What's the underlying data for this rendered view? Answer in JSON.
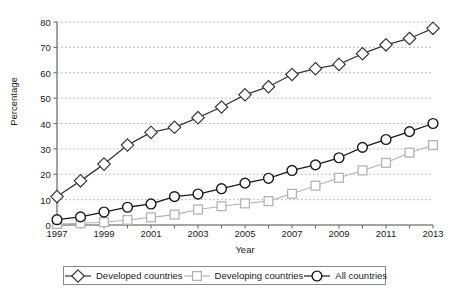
{
  "chart_data": {
    "type": "line",
    "title": "",
    "xlabel": "Year",
    "ylabel": "Percentage",
    "xlim": [
      1997,
      2013
    ],
    "ylim": [
      0,
      80
    ],
    "yticks": [
      0,
      10,
      20,
      30,
      40,
      50,
      60,
      70,
      80
    ],
    "xticks": [
      1997,
      1998,
      1999,
      2000,
      2001,
      2002,
      2003,
      2004,
      2005,
      2006,
      2007,
      2008,
      2009,
      2010,
      2011,
      2012,
      2013
    ],
    "xtick_labels_shown": [
      1997,
      1999,
      2001,
      2003,
      2005,
      2007,
      2009,
      2011,
      2013
    ],
    "grid": "horizontal-dotted",
    "legend_position": "below-axis",
    "x": [
      1997,
      1998,
      1999,
      2000,
      2001,
      2002,
      2003,
      2004,
      2005,
      2006,
      2007,
      2008,
      2009,
      2010,
      2011,
      2012,
      2013
    ],
    "series": [
      {
        "name": "Developed countries",
        "marker": "diamond",
        "color": "#3a3a3a",
        "values": [
          11.2,
          17.4,
          24.0,
          31.5,
          36.5,
          38.5,
          42.3,
          46.5,
          51.3,
          54.5,
          59.3,
          61.6,
          63.3,
          67.5,
          71.0,
          73.5,
          77.5
        ]
      },
      {
        "name": "Developing countries",
        "marker": "square",
        "color": "#b3b3b3",
        "values": [
          0.4,
          0.7,
          1.1,
          2.0,
          3.0,
          4.1,
          6.1,
          7.4,
          8.5,
          9.4,
          12.3,
          15.5,
          18.6,
          21.5,
          24.5,
          28.5,
          31.5
        ]
      },
      {
        "name": "All countries",
        "marker": "circle",
        "color": "#1a1a1a",
        "values": [
          2.1,
          3.2,
          5.1,
          7.0,
          8.3,
          11.2,
          12.2,
          14.3,
          16.5,
          18.4,
          21.5,
          23.7,
          26.5,
          30.6,
          33.7,
          36.8,
          40.0
        ]
      }
    ]
  },
  "axis": {
    "y_label": "Percentage",
    "x_label": "Year"
  },
  "legend": {
    "items": [
      {
        "label": "Developed countries",
        "marker": "diamond-marker",
        "color": "#3a3a3a"
      },
      {
        "label": "Developing countries",
        "marker": "square-marker",
        "color": "#b3b3b3"
      },
      {
        "label": "All countries",
        "marker": "circle-marker",
        "color": "#1a1a1a"
      }
    ]
  }
}
